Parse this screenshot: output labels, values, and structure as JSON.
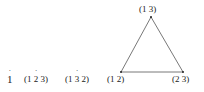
{
  "diagram": {
    "elements_row": [
      {
        "text": "1",
        "dotted": true,
        "x": 7
      },
      {
        "pre": "(1 ",
        "dotted_char": "2",
        "post": " 3)",
        "x": 24
      },
      {
        "pre": "(1 ",
        "dotted_char": "3",
        "post": " 2)",
        "x": 65
      },
      {
        "text": "(1 2)",
        "x": 106
      }
    ],
    "triangle": {
      "vertices": [
        {
          "label": "(1 3)",
          "x": 151,
          "y": 17
        },
        {
          "label": "(1 2)",
          "x": 121,
          "y": 72
        },
        {
          "label": "(2 3)",
          "x": 183,
          "y": 72
        }
      ],
      "edge_color": "#555555"
    }
  }
}
